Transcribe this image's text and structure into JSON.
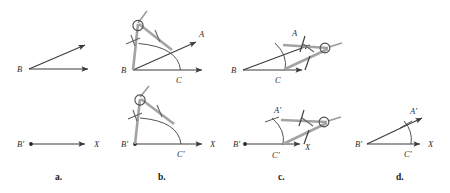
{
  "figure": {
    "stroke_color": "#3a3a3a",
    "compass_color": "#8f8f8f",
    "arc_color": "#4a4a4a",
    "background": "#ffffff",
    "rows": 2,
    "columns": 4
  },
  "captions": [
    {
      "key": "a",
      "label": "a."
    },
    {
      "key": "b",
      "label": "b."
    },
    {
      "key": "c",
      "label": "c."
    },
    {
      "key": "d",
      "label": "d."
    }
  ],
  "panels": {
    "a_top": {
      "caption": "a.",
      "description": "Given angle with vertex B and two rays",
      "labels": {
        "vertex": "B"
      },
      "has_compass": false,
      "has_arc": false
    },
    "a_bottom": {
      "caption": "a.",
      "description": "Ray B prime toward X drawn as the base of the copy",
      "labels": {
        "vertex": "B'",
        "ray_end": "X"
      },
      "has_compass": false,
      "has_arc": false
    },
    "b_top": {
      "caption": "b.",
      "description": "Compass centered at B draws an arc crossing both rays at A and C",
      "labels": {
        "vertex": "B",
        "upper_ray": "A",
        "lower_point": "C"
      },
      "has_compass": true,
      "has_arc": true
    },
    "b_bottom": {
      "caption": "b.",
      "description": "Same compass setting centered at B prime draws an arc crossing ray X at C prime",
      "labels": {
        "vertex": "B'",
        "ray_end": "X",
        "lower_point": "C'"
      },
      "has_compass": true,
      "has_arc": true
    },
    "c_top": {
      "caption": "c.",
      "description": "Compass measures the distance from C to A on the original angle",
      "labels": {
        "vertex": "B",
        "upper_point": "A",
        "lower_point": "C"
      },
      "has_compass": true,
      "has_arc": true
    },
    "c_bottom": {
      "caption": "c.",
      "description": "Compass centered at C prime strikes an arc locating A prime",
      "labels": {
        "vertex": "B'",
        "upper_point": "A'",
        "lower_point": "C'",
        "ray_end": "X"
      },
      "has_compass": true,
      "has_arc": true
    },
    "d_bottom": {
      "caption": "d.",
      "description": "Ray drawn from B prime through A prime completes the copied angle",
      "labels": {
        "vertex": "B'",
        "upper_point": "A'",
        "lower_point": "C'",
        "ray_end": "X"
      },
      "has_compass": false,
      "has_arc": true
    }
  }
}
